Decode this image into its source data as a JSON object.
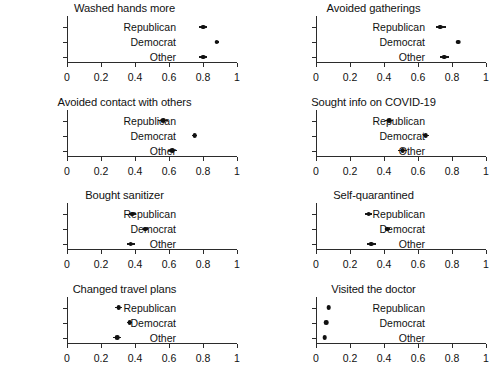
{
  "figure": {
    "categories": [
      "Republican",
      "Democrat",
      "Other"
    ],
    "x_ticks": [
      "0",
      "0.2",
      "0.4",
      "0.6",
      "0.8",
      "1"
    ],
    "x_tick_values": [
      0,
      0.2,
      0.4,
      0.6,
      0.8,
      1
    ],
    "xlim": [
      0,
      1
    ],
    "dot_color": "#111111",
    "axis_color": "#2b2b2b"
  },
  "chart_data": [
    {
      "type": "scatter",
      "title": "Washed hands more",
      "xlabel": "",
      "ylabel": "",
      "xlim": [
        0,
        1
      ],
      "grid": false,
      "legend": "none",
      "categories": [
        "Republican",
        "Democrat",
        "Other"
      ],
      "values": [
        0.8,
        0.88,
        0.8
      ],
      "ci_low": [
        0.775,
        0.868,
        0.778
      ],
      "ci_high": [
        0.825,
        0.892,
        0.822
      ]
    },
    {
      "type": "scatter",
      "title": "Avoided gatherings",
      "xlabel": "",
      "ylabel": "",
      "xlim": [
        0,
        1
      ],
      "grid": false,
      "legend": "none",
      "categories": [
        "Republican",
        "Democrat",
        "Other"
      ],
      "values": [
        0.73,
        0.835,
        0.755
      ],
      "ci_low": [
        0.705,
        0.822,
        0.73
      ],
      "ci_high": [
        0.762,
        0.848,
        0.782
      ]
    },
    {
      "type": "scatter",
      "title": "Avoided contact with others",
      "xlabel": "",
      "ylabel": "",
      "xlim": [
        0,
        1
      ],
      "grid": false,
      "legend": "none",
      "categories": [
        "Republican",
        "Democrat",
        "Other"
      ],
      "values": [
        0.565,
        0.75,
        0.62
      ],
      "ci_low": [
        0.538,
        0.735,
        0.592
      ],
      "ci_high": [
        0.592,
        0.765,
        0.648
      ]
    },
    {
      "type": "scatter",
      "title": "Sought info on COVID-19",
      "xlabel": "",
      "ylabel": "",
      "xlim": [
        0,
        1
      ],
      "grid": false,
      "legend": "none",
      "categories": [
        "Republican",
        "Democrat",
        "Other"
      ],
      "values": [
        0.43,
        0.645,
        0.51
      ],
      "ci_low": [
        0.405,
        0.628,
        0.482
      ],
      "ci_high": [
        0.455,
        0.662,
        0.538
      ]
    },
    {
      "type": "scatter",
      "title": "Bought sanitizer",
      "xlabel": "",
      "ylabel": "",
      "xlim": [
        0,
        1
      ],
      "grid": false,
      "legend": "none",
      "categories": [
        "Republican",
        "Democrat",
        "Other"
      ],
      "values": [
        0.385,
        0.46,
        0.375
      ],
      "ci_low": [
        0.362,
        0.445,
        0.35
      ],
      "ci_high": [
        0.408,
        0.475,
        0.4
      ]
    },
    {
      "type": "scatter",
      "title": "Self-quarantined",
      "xlabel": "",
      "ylabel": "",
      "xlim": [
        0,
        1
      ],
      "grid": false,
      "legend": "none",
      "categories": [
        "Republican",
        "Democrat",
        "Other"
      ],
      "values": [
        0.31,
        0.42,
        0.325
      ],
      "ci_low": [
        0.288,
        0.405,
        0.3
      ],
      "ci_high": [
        0.332,
        0.435,
        0.35
      ]
    },
    {
      "type": "scatter",
      "title": "Changed travel plans",
      "xlabel": "",
      "ylabel": "",
      "xlim": [
        0,
        1
      ],
      "grid": false,
      "legend": "none",
      "categories": [
        "Republican",
        "Democrat",
        "Other"
      ],
      "values": [
        0.305,
        0.37,
        0.295
      ],
      "ci_low": [
        0.285,
        0.355,
        0.272
      ],
      "ci_high": [
        0.325,
        0.385,
        0.318
      ]
    },
    {
      "type": "scatter",
      "title": "Visited the doctor",
      "xlabel": "",
      "ylabel": "",
      "xlim": [
        0,
        1
      ],
      "grid": false,
      "legend": "none",
      "categories": [
        "Republican",
        "Democrat",
        "Other"
      ],
      "values": [
        0.075,
        0.06,
        0.05
      ],
      "ci_low": [
        0.065,
        0.052,
        0.04
      ],
      "ci_high": [
        0.085,
        0.068,
        0.06
      ]
    }
  ]
}
